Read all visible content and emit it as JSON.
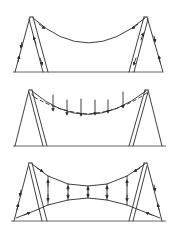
{
  "figure": {
    "stroke_color": "#2a2a2a",
    "background": "#ffffff",
    "panels": [
      {
        "id": "panel-1",
        "label": "Sagging cable between two A-frames with force arrows along legs",
        "ground_y": 72,
        "left_apex": [
          30,
          17
        ],
        "right_apex": [
          147,
          17
        ],
        "cable_sag_y": 43
      },
      {
        "id": "panel-2",
        "label": "Cable under vertical loads, deflected (dashed) shape",
        "ground_y": 146,
        "left_apex": [
          30,
          90
        ],
        "right_apex": [
          147,
          90
        ],
        "load_arrow_x": [
          53,
          67,
          81,
          95,
          108,
          123
        ]
      },
      {
        "id": "panel-3",
        "label": "Prestressed cable net: upper and lower cables linked by vertical ties",
        "ground_y": 221,
        "left_apex": [
          30,
          163
        ],
        "right_apex": [
          147,
          163
        ],
        "tie_x": [
          48,
          68,
          88,
          107,
          127
        ]
      }
    ]
  }
}
